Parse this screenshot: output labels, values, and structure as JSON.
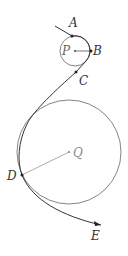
{
  "diagram": {
    "colors": {
      "path": "#333333",
      "circle": "#777777",
      "radius": "#999999",
      "point": "#222222",
      "label": "#333333"
    },
    "circles": [
      {
        "name": "P",
        "cx": 75,
        "cy": 51,
        "r": 15
      },
      {
        "name": "Q",
        "cx": 69,
        "cy": 152,
        "r": 52
      }
    ],
    "points": [
      {
        "name": "A",
        "x": 72,
        "y": 36,
        "label_x": 69,
        "label_y": 27
      },
      {
        "name": "B",
        "x": 91,
        "y": 51,
        "label_x": 93,
        "label_y": 55
      },
      {
        "name": "C",
        "x": 76,
        "y": 72,
        "label_x": 79,
        "label_y": 85
      },
      {
        "name": "D",
        "x": 22,
        "y": 175,
        "label_x": 7,
        "label_y": 180
      },
      {
        "name": "E",
        "x": 101,
        "y": 225,
        "label_x": 91,
        "label_y": 240
      },
      {
        "name": "P",
        "x": 75,
        "y": 51,
        "label_x": 62,
        "label_y": 55
      },
      {
        "name": "Q",
        "x": 69,
        "y": 152,
        "label_x": 73,
        "label_y": 157
      }
    ],
    "labels": {
      "A": "A",
      "B": "B",
      "C": "C",
      "D": "D",
      "E": "E",
      "P": "P",
      "Q": "Q"
    }
  }
}
